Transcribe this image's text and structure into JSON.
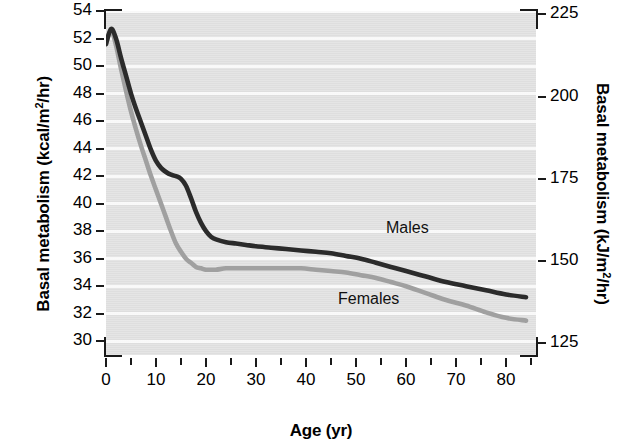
{
  "chart_data": {
    "type": "line",
    "title": "",
    "xlabel": "Age (yr)",
    "ylabel": "Basal metabolism (kcal/m²/hr)",
    "ylabel_right": "Basal metabolism (kJ/m²/hr)",
    "xlim": [
      0,
      86
    ],
    "ylim": [
      29,
      54
    ],
    "ylim_right": [
      121.5,
      226
    ],
    "grid": "horizontal-bands",
    "legend_position": "inline-annotation",
    "xticks": [
      0,
      10,
      20,
      30,
      40,
      50,
      60,
      70,
      80
    ],
    "xtick_labels": [
      "0",
      "10",
      "20",
      "30",
      "40",
      "50",
      "60",
      "70",
      "80"
    ],
    "xticks_minor": [
      5,
      15,
      25,
      35,
      45,
      55,
      65,
      75,
      85
    ],
    "yticks": [
      30,
      32,
      34,
      36,
      38,
      40,
      42,
      44,
      46,
      48,
      50,
      52,
      54
    ],
    "ytick_labels": [
      "30",
      "32",
      "34",
      "36",
      "38",
      "40",
      "42",
      "44",
      "46",
      "48",
      "50",
      "52",
      "54"
    ],
    "yticks_right": [
      125,
      150,
      175,
      200,
      225
    ],
    "ytick_labels_right": [
      "125",
      "150",
      "175",
      "200",
      "225"
    ],
    "series": [
      {
        "name": "Males",
        "color": "#2b2b2b",
        "label_text": "Males",
        "x": [
          0,
          1,
          2,
          3,
          4,
          5,
          6,
          7,
          8,
          9,
          10,
          11,
          12,
          13,
          14,
          15,
          16,
          17,
          18,
          19,
          20,
          21,
          22,
          24,
          26,
          28,
          30,
          33,
          36,
          39,
          42,
          45,
          48,
          51,
          54,
          57,
          60,
          64,
          68,
          72,
          76,
          80,
          84
        ],
        "values": [
          51.6,
          52.7,
          52.0,
          50.6,
          49.3,
          48.0,
          46.9,
          45.9,
          44.9,
          43.9,
          43.1,
          42.6,
          42.3,
          42.1,
          42.0,
          41.8,
          41.3,
          40.4,
          39.4,
          38.6,
          38.0,
          37.6,
          37.4,
          37.2,
          37.1,
          37.0,
          36.9,
          36.8,
          36.7,
          36.6,
          36.5,
          36.4,
          36.2,
          36.0,
          35.7,
          35.4,
          35.1,
          34.7,
          34.3,
          34.0,
          33.7,
          33.4,
          33.2
        ]
      },
      {
        "name": "Females",
        "color": "#a0a0a0",
        "label_text": "Females",
        "x": [
          0,
          1,
          2,
          3,
          4,
          5,
          6,
          7,
          8,
          9,
          10,
          11,
          12,
          13,
          14,
          15,
          16,
          17,
          18,
          19,
          20,
          21,
          22,
          24,
          26,
          28,
          30,
          33,
          36,
          39,
          42,
          45,
          48,
          51,
          54,
          57,
          60,
          64,
          68,
          72,
          76,
          80,
          84
        ],
        "values": [
          51.6,
          52.6,
          51.5,
          49.8,
          48.2,
          46.7,
          45.4,
          44.2,
          43.1,
          42.0,
          41.0,
          40.0,
          39.0,
          38.0,
          37.1,
          36.5,
          36.0,
          35.7,
          35.4,
          35.3,
          35.2,
          35.2,
          35.2,
          35.3,
          35.3,
          35.3,
          35.3,
          35.3,
          35.3,
          35.3,
          35.2,
          35.1,
          35.0,
          34.8,
          34.6,
          34.3,
          34.0,
          33.5,
          33.0,
          32.6,
          32.1,
          31.7,
          31.5
        ]
      }
    ]
  }
}
